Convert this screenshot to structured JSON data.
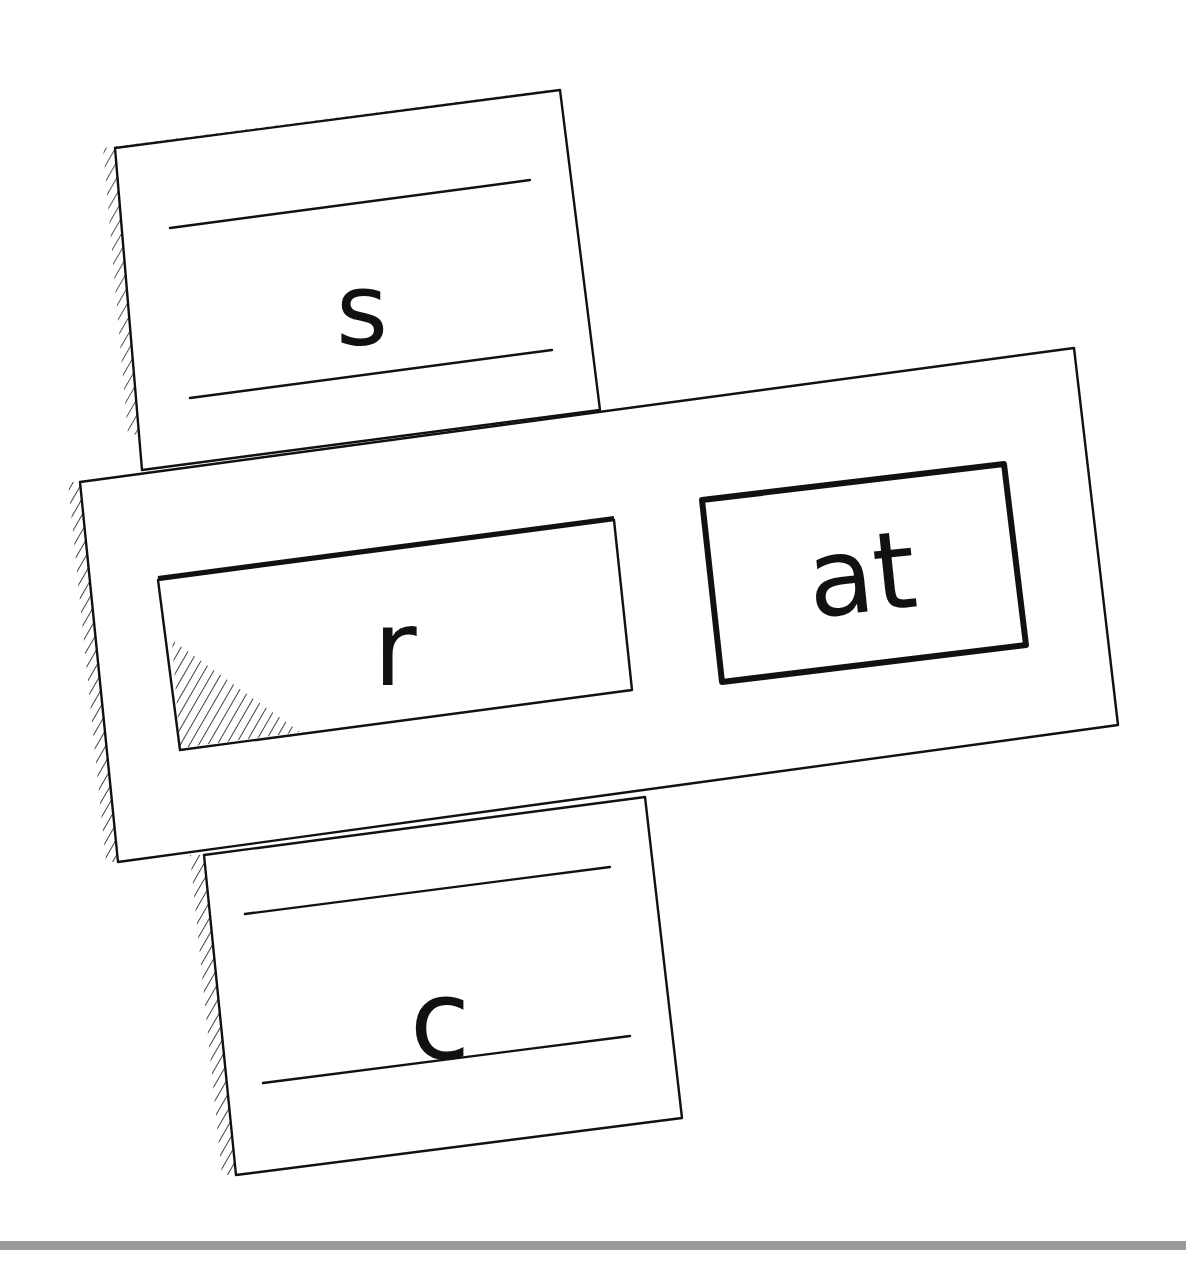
{
  "diagram": {
    "strip_letters": [
      "s",
      "r",
      "c"
    ],
    "top_card": {
      "letter": "s"
    },
    "window_card": {
      "letter": "r"
    },
    "bottom_card": {
      "letter": "c"
    },
    "ending_box": {
      "text": "at"
    },
    "colors": {
      "ink": "#111111",
      "paper": "#ffffff",
      "bottom_bar": "#9a9a9a"
    }
  }
}
